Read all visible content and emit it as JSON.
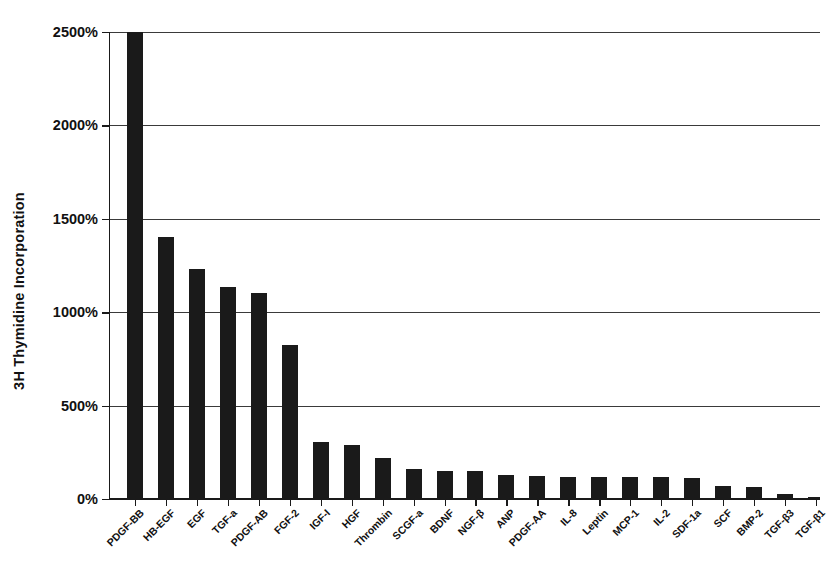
{
  "chart_data": {
    "type": "bar",
    "title": "",
    "subtitle": "",
    "xlabel": "",
    "ylabel": "3H Thymidine Incorporation",
    "ylim": [
      0,
      2500
    ],
    "yunit": "%",
    "ytick_labels": [
      "2500%",
      "2000%",
      "1500%",
      "1000%",
      "500%",
      "0%"
    ],
    "ytick_values": [
      2500,
      2000,
      1500,
      1000,
      500,
      0
    ],
    "grid": true,
    "legend": "none",
    "bar_color": "#1a1a1a",
    "note_clipped": "PDGF-BB bar is clipped at the 2500% axis maximum",
    "categories": [
      "PDGF-BB",
      "HB-EGF",
      "EGF",
      "TGF-a",
      "PDGF-AB",
      "FGF-2",
      "IGF-I",
      "HGF",
      "Thrombin",
      "SCGF-a",
      "BDNF",
      "NGF-β",
      "ANP",
      "PDGF-AA",
      "IL-8",
      "Leptin",
      "MCP-1",
      "IL-2",
      "SDF-1a",
      "SCF",
      "BMP-2",
      "TGF-β3",
      "TGF-β1"
    ],
    "values": [
      2500,
      1395,
      1225,
      1130,
      1095,
      820,
      300,
      282,
      215,
      155,
      145,
      143,
      125,
      118,
      115,
      112,
      110,
      110,
      108,
      65,
      60,
      22,
      3
    ]
  }
}
